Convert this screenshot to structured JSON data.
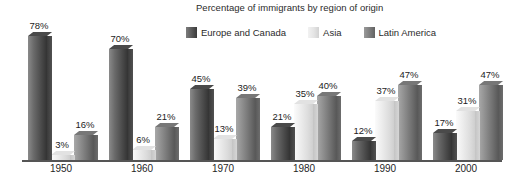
{
  "chart_data": {
    "type": "bar",
    "title": "Percentage of immigrants by region of origin",
    "xlabel": "",
    "ylabel": "",
    "ylim": [
      0,
      80
    ],
    "grid": false,
    "legend_position": "top-right",
    "value_labels": true,
    "value_suffix": "%",
    "categories": [
      "1950",
      "1960",
      "1970",
      "1980",
      "1990",
      "2000"
    ],
    "series": [
      {
        "name": "Europe and Canada",
        "color": "#4a4a4a",
        "values": [
          78,
          70,
          45,
          21,
          12,
          17
        ],
        "labels": [
          "78%",
          "70%",
          "45%",
          "21%",
          "12%",
          "17%"
        ]
      },
      {
        "name": "Asia",
        "color": "#e4e4e4",
        "values": [
          3,
          6,
          13,
          35,
          37,
          31
        ],
        "labels": [
          "3%",
          "6%",
          "13%",
          "35%",
          "37%",
          "31%"
        ]
      },
      {
        "name": "Latin America",
        "color": "#7f7f7f",
        "values": [
          16,
          21,
          39,
          40,
          47,
          47
        ],
        "labels": [
          "16%",
          "21%",
          "39%",
          "40%",
          "47%",
          "47%"
        ]
      }
    ]
  },
  "legend": {
    "items": [
      {
        "label": "Europe and Canada",
        "swatch": "legend-swatch-europe-canada"
      },
      {
        "label": "Asia",
        "swatch": "legend-swatch-asia"
      },
      {
        "label": "Latin America",
        "swatch": "legend-swatch-latin-america"
      }
    ]
  },
  "axis": {
    "tick_labels": [
      "1950",
      "1960",
      "1970",
      "1980",
      "1990",
      "2000"
    ]
  }
}
